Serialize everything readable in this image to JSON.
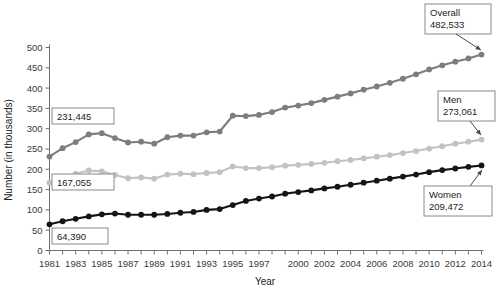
{
  "chart_data": {
    "type": "line",
    "title": "",
    "xlabel": "Year",
    "ylabel": "Number (in thousands)",
    "ylim": [
      0,
      500
    ],
    "ytick_step": 50,
    "yticks": [
      0,
      50,
      100,
      150,
      200,
      250,
      300,
      350,
      400,
      450,
      500
    ],
    "grid": false,
    "legend_position": "none",
    "x": [
      1981,
      1982,
      1983,
      1984,
      1985,
      1986,
      1987,
      1988,
      1989,
      1990,
      1991,
      1992,
      1993,
      1994,
      1995,
      1996,
      1997,
      1998,
      1999,
      2000,
      2001,
      2002,
      2003,
      2004,
      2005,
      2006,
      2007,
      2008,
      2009,
      2010,
      2011,
      2012,
      2013,
      2014
    ],
    "xtick_labels": [
      "1981",
      "1983",
      "1985",
      "1987",
      "1989",
      "1991",
      "1993",
      "1995",
      "1997",
      "2000",
      "2002",
      "2004",
      "2006",
      "2008",
      "2010",
      "2012",
      "2014"
    ],
    "xtick_values": [
      1981,
      1983,
      1985,
      1987,
      1989,
      1991,
      1993,
      1995,
      1997,
      2000,
      2002,
      2004,
      2006,
      2008,
      2010,
      2012,
      2014
    ],
    "series": [
      {
        "name": "Overall",
        "color": "#7d7d7d",
        "values": [
          231.4,
          252.0,
          267.0,
          286.0,
          289.0,
          277.0,
          266.0,
          268.0,
          263.0,
          279.0,
          283.0,
          283.0,
          291.0,
          293.0,
          332.0,
          331.0,
          334.0,
          341.0,
          352.0,
          357.0,
          363.0,
          371.0,
          379.0,
          387.0,
          396.0,
          404.0,
          413.0,
          423.0,
          434.0,
          446.0,
          456.0,
          465.0,
          473.0,
          482.5
        ]
      },
      {
        "name": "Men",
        "color": "#c2c2c2",
        "values": [
          167.1,
          180.0,
          189.0,
          197.0,
          195.0,
          186.0,
          178.0,
          180.0,
          177.0,
          187.0,
          189.0,
          188.0,
          191.0,
          193.0,
          207.0,
          203.0,
          203.0,
          205.0,
          209.0,
          211.0,
          213.0,
          216.0,
          220.0,
          223.0,
          227.0,
          231.0,
          235.0,
          240.0,
          245.0,
          251.0,
          257.0,
          263.0,
          268.0,
          273.1
        ]
      },
      {
        "name": "Women",
        "color": "#151515",
        "values": [
          64.4,
          72.0,
          78.0,
          84.0,
          89.0,
          91.0,
          88.0,
          88.0,
          88.0,
          90.0,
          93.0,
          95.0,
          100.0,
          102.0,
          112.0,
          122.0,
          128.0,
          133.0,
          140.0,
          144.0,
          148.0,
          153.0,
          157.0,
          162.0,
          167.0,
          172.0,
          177.0,
          182.0,
          187.0,
          193.0,
          198.0,
          202.0,
          206.0,
          209.5
        ]
      }
    ],
    "annotations": [
      {
        "id": "overall-start",
        "text": "231,445",
        "series": "Overall",
        "year": 1981,
        "value": 231.445,
        "side": "left"
      },
      {
        "id": "men-start",
        "text": "167,055",
        "series": "Men",
        "year": 1981,
        "value": 167.055,
        "side": "left"
      },
      {
        "id": "women-start",
        "text": "64,390",
        "series": "Women",
        "year": 1981,
        "value": 64.39,
        "side": "left"
      },
      {
        "id": "overall-end",
        "label": "Overall",
        "text": "482,533",
        "series": "Overall",
        "year": 2014,
        "value": 482.533,
        "side": "right"
      },
      {
        "id": "men-end",
        "label": "Men",
        "text": "273,061",
        "series": "Men",
        "year": 2014,
        "value": 273.061,
        "side": "right"
      },
      {
        "id": "women-end",
        "label": "Women",
        "text": "209,472",
        "series": "Women",
        "year": 2014,
        "value": 209.472,
        "side": "right"
      }
    ]
  },
  "callouts": {
    "overall_start": "231,445",
    "men_start": "167,055",
    "women_start": "64,390",
    "overall_label": "Overall",
    "overall_value": "482,533",
    "men_label": "Men",
    "men_value": "273,061",
    "women_label": "Women",
    "women_value": "209,472"
  },
  "axes": {
    "y_title": "Number (in thousands)",
    "x_title": "Year"
  }
}
